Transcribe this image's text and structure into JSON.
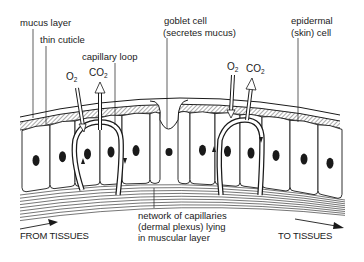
{
  "diagram": {
    "type": "biology-illustration",
    "labels": {
      "mucus_layer": "mucus layer",
      "thin_cuticle": "thin cuticle",
      "capillary_loop": "capillary loop",
      "goblet_cell_line1": "goblet cell",
      "goblet_cell_line2": "(secretes mucus)",
      "epidermal_cell_line1": "epidermal",
      "epidermal_cell_line2": "(skin) cell",
      "network_line1": "network of capillaries",
      "network_line2": "(dermal plexus) lying",
      "network_line3": "in muscular layer",
      "from_tissues": "FROM TISSUES",
      "to_tissues": "TO TISSUES"
    },
    "gases": {
      "left": {
        "o2": "O",
        "o2_sub": "2",
        "co2": "CO",
        "co2_sub": "2"
      },
      "right": {
        "o2": "O",
        "o2_sub": "2",
        "co2": "CO",
        "co2_sub": "2"
      }
    },
    "colors": {
      "ink": "#1a1a1a",
      "cuticle_fill": "#9a9a9a",
      "background": "#ffffff"
    }
  }
}
